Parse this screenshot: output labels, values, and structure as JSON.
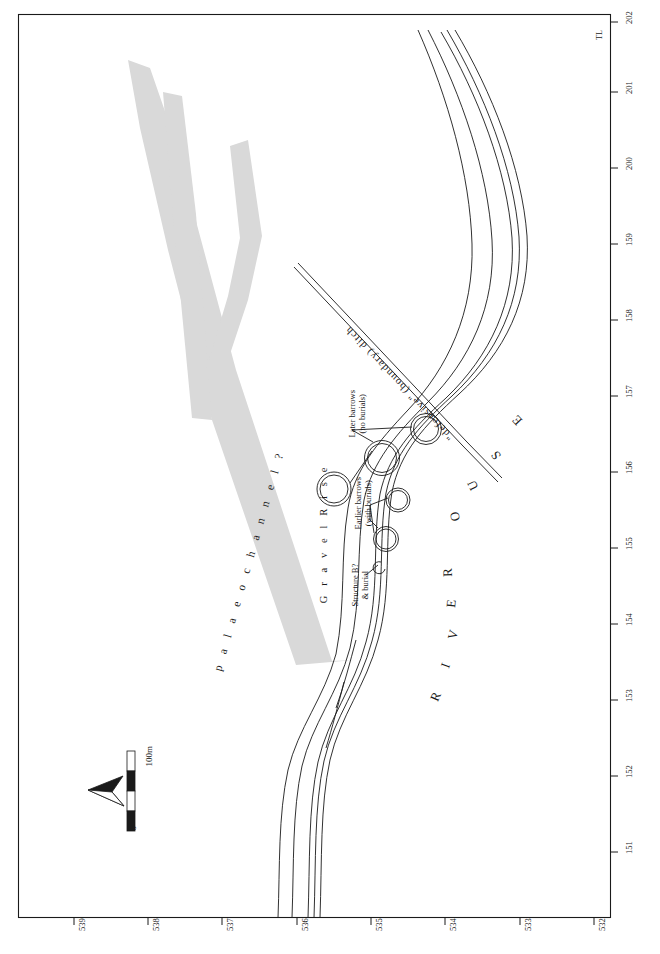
{
  "figure": {
    "type": "archaeological-site-plan"
  },
  "frame": {
    "corner_label": "TL",
    "bottom_axis": {
      "name": "northing-gridline-labels",
      "labels": [
        "539",
        "538",
        "537",
        "536",
        "535",
        "534",
        "533",
        "532"
      ]
    },
    "right_axis": {
      "name": "easting-gridline-labels",
      "labels": [
        "151",
        "152",
        "153",
        "154",
        "155",
        "156",
        "157",
        "158",
        "159",
        "200",
        "201",
        "202"
      ]
    }
  },
  "annotations": {
    "palaeochannel": "p a l a e o c h a n n e l  ?",
    "gravel_rise": "G r a v e l   R i s e",
    "river": "R I V E R   O U S E",
    "ditch": "\"defensive\" (boundary) ditch",
    "later_barrows_line1": "Later barrows",
    "later_barrows_line2": "(no burials)",
    "earlier_barrows_line1": "Earlier barrows",
    "earlier_barrows_line2": "(with burials)",
    "structure_line1": "Structure B?",
    "structure_line2": "& burial"
  },
  "scale_bar": {
    "name": "scale-bar",
    "min_label": "0",
    "max_label": "100m",
    "units": "m",
    "segments": 4,
    "segment_length_m": 25
  },
  "north_arrow": {
    "name": "north-arrow",
    "points_toward": "left"
  },
  "colors": {
    "ink": "#1a1a1a",
    "palaeochannel_fill": "#d9d9d9",
    "paper": "#ffffff"
  }
}
